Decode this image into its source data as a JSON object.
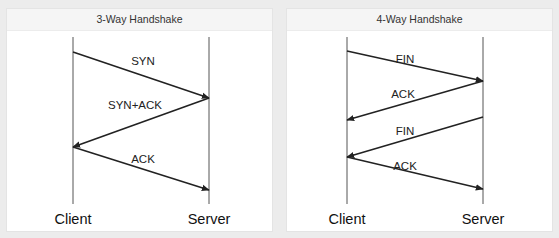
{
  "colors": {
    "background": "#ececec",
    "panel": "#ffffff",
    "header": "#f5f5f5",
    "line": "#222222"
  },
  "diagrams": [
    {
      "title": "3-Way Handshake",
      "actors": {
        "left": {
          "label": "Client",
          "x": 66
        },
        "right": {
          "label": "Server",
          "x": 202
        }
      },
      "lifeline": {
        "top": 28,
        "bottom": 195
      },
      "messages": [
        {
          "label": "SYN",
          "from": "left",
          "y1": 43,
          "y2": 89,
          "label_x": 136,
          "label_y": 56
        },
        {
          "label": "SYN+ACK",
          "from": "right",
          "y1": 89,
          "y2": 138,
          "label_x": 128,
          "label_y": 100
        },
        {
          "label": "ACK",
          "from": "left",
          "y1": 138,
          "y2": 181,
          "label_x": 136,
          "label_y": 154
        }
      ]
    },
    {
      "title": "4-Way Handshake",
      "actors": {
        "left": {
          "label": "Client",
          "x": 60
        },
        "right": {
          "label": "Server",
          "x": 196
        }
      },
      "lifeline": {
        "top": 28,
        "bottom": 195
      },
      "messages": [
        {
          "label": "FIN",
          "from": "left",
          "y1": 42,
          "y2": 72,
          "label_x": 118,
          "label_y": 54
        },
        {
          "label": "ACK",
          "from": "right",
          "y1": 72,
          "y2": 111,
          "label_x": 116,
          "label_y": 89
        },
        {
          "label": "FIN",
          "from": "right",
          "y1": 108,
          "y2": 148,
          "label_x": 118,
          "label_y": 126
        },
        {
          "label": "ACK",
          "from": "left",
          "y1": 148,
          "y2": 180,
          "label_x": 118,
          "label_y": 161
        }
      ]
    }
  ]
}
